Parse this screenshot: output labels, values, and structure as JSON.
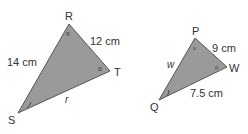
{
  "triangle1": {
    "vertices": {
      "R": "R",
      "T": "T",
      "S": "S"
    },
    "sides": {
      "RS": "14 cm",
      "RT": "12 cm",
      "ST": "r"
    },
    "angles": {
      "R": "x",
      "T": "o"
    }
  },
  "triangle2": {
    "vertices": {
      "P": "P",
      "W": "W",
      "Q": "Q"
    },
    "sides": {
      "PQ": "w",
      "PW": "9 cm",
      "QW": "7.5 cm"
    },
    "angles": {
      "P": "x",
      "W": "o"
    }
  },
  "colors": {
    "fill": "#9a9a9a",
    "stroke": "#555555",
    "text": "#333333"
  }
}
